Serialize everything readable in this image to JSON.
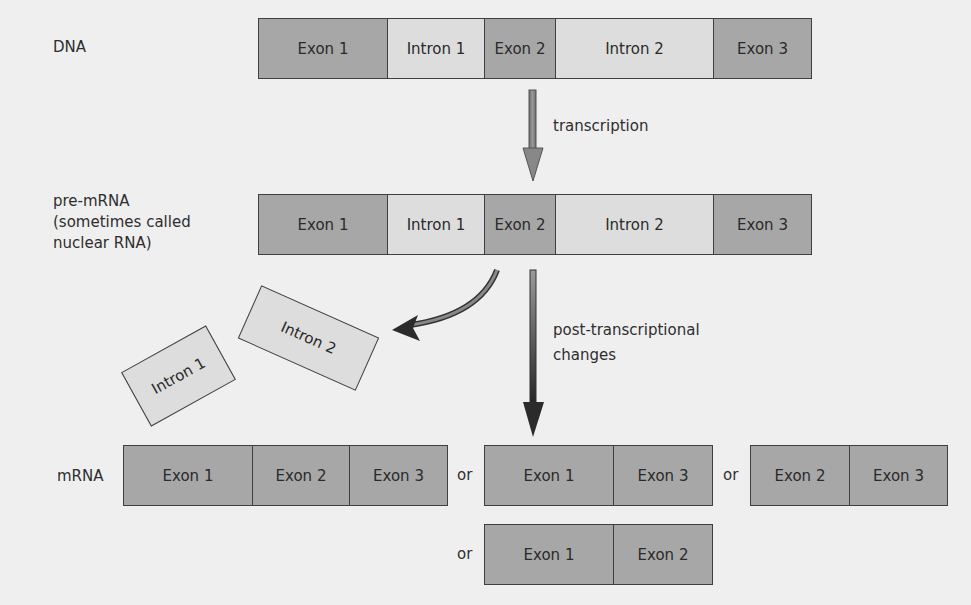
{
  "rows": {
    "dna": {
      "label": "DNA",
      "segments": [
        {
          "label": "Exon 1",
          "type": "exon",
          "width": 129
        },
        {
          "label": "Intron 1",
          "type": "intron",
          "width": 97
        },
        {
          "label": "Exon 2",
          "type": "exon",
          "width": 71
        },
        {
          "label": "Intron 2",
          "type": "intron",
          "width": 158
        },
        {
          "label": "Exon 3",
          "type": "exon",
          "width": 99
        }
      ]
    },
    "pre_mrna": {
      "label_lines": [
        "pre-mRNA",
        "(sometimes called",
        "nuclear RNA)"
      ],
      "segments": [
        {
          "label": "Exon 1",
          "type": "exon"
        },
        {
          "label": "Intron 1",
          "type": "intron"
        },
        {
          "label": "Exon 2",
          "type": "exon"
        },
        {
          "label": "Intron 2",
          "type": "intron"
        },
        {
          "label": "Exon 3",
          "type": "exon"
        }
      ]
    },
    "mrna": {
      "label": "mRNA",
      "separator": "or",
      "variants": [
        {
          "segments": [
            "Exon 1",
            "Exon 2",
            "Exon 3"
          ]
        },
        {
          "segments": [
            "Exon 1",
            "Exon 3"
          ]
        },
        {
          "segments": [
            "Exon 2",
            "Exon 3"
          ]
        },
        {
          "segments": [
            "Exon 1",
            "Exon 2"
          ]
        }
      ]
    }
  },
  "arrows": {
    "transcription": "transcription",
    "post_transcriptional_line1": "post-transcriptional",
    "post_transcriptional_line2": "changes"
  },
  "excised_introns": [
    {
      "label": "Intron 1"
    },
    {
      "label": "Intron 2"
    }
  ],
  "colors": {
    "background": "#efefef",
    "exon": "#a7a7a7",
    "intron": "#dddddd",
    "border": "#3f3f3f"
  }
}
